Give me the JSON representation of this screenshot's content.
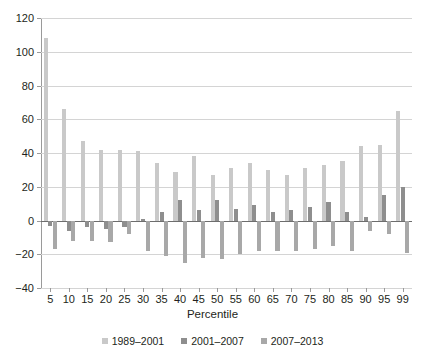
{
  "chart_data": {
    "type": "bar",
    "title": "",
    "xlabel": "Percentile",
    "ylabel": "",
    "ylim": [
      -40,
      120
    ],
    "yticks": [
      -40,
      -20,
      0,
      20,
      40,
      60,
      80,
      100,
      120
    ],
    "grid": true,
    "legend_position": "bottom",
    "categories": [
      "5",
      "10",
      "15",
      "20",
      "25",
      "30",
      "35",
      "40",
      "45",
      "50",
      "55",
      "60",
      "65",
      "70",
      "75",
      "80",
      "85",
      "90",
      "95",
      "99"
    ],
    "series": [
      {
        "name": "1989–2001",
        "color": "#c9c9c9",
        "values": [
          108,
          66,
          47,
          42,
          42,
          41,
          34,
          29,
          38,
          27,
          31,
          34,
          30,
          27,
          31,
          33,
          35,
          44,
          45,
          65
        ]
      },
      {
        "name": "2001–2007",
        "color": "#8e8e8e",
        "values": [
          -3,
          -6,
          -4,
          -5,
          -4,
          1,
          5,
          12,
          6,
          12,
          7,
          9,
          5,
          6,
          8,
          11,
          5,
          2,
          15,
          20
        ]
      },
      {
        "name": "2007–2013",
        "color": "#a8a8a8",
        "values": [
          -17,
          -12,
          -12,
          -13,
          -8,
          -18,
          -21,
          -25,
          -22,
          -23,
          -20,
          -18,
          -18,
          -18,
          -17,
          -15,
          -18,
          -6,
          -8,
          -19
        ]
      }
    ]
  },
  "axis": {
    "x_title": "Percentile"
  }
}
